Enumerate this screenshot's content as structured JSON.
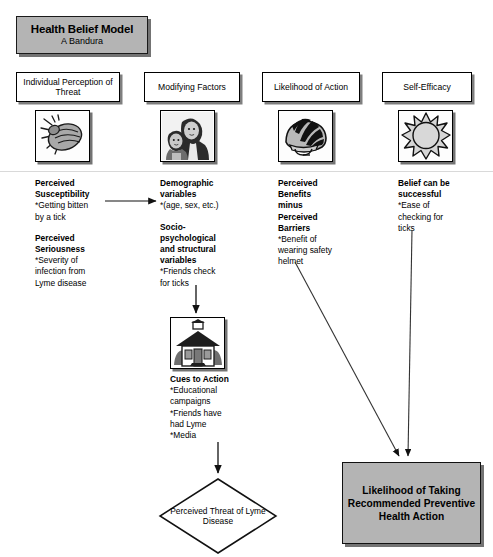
{
  "title": {
    "main": "Health Belief Model",
    "sub": "A Bandura"
  },
  "columns": [
    {
      "id": "individual-perception-of-threat",
      "header": "Individual Perception\nof Threat",
      "icon": "tick-icon",
      "blocks": [
        {
          "heading": "Perceived\nSusceptibility",
          "detail": "*Getting bitten\nby a tick"
        },
        {
          "heading": "Perceived\nSeriousness",
          "detail": "*Severity of\ninfection from\nLyme disease"
        }
      ]
    },
    {
      "id": "modifying-factors",
      "header": "Modifying Factors",
      "icon": "mother-and-child-icon",
      "blocks": [
        {
          "heading": "Demographic\nvariables",
          "detail": "*(age, sex, etc.)"
        },
        {
          "heading": "Socio-\npsychological\nand structural\nvariables",
          "detail": "*Friends check\nfor ticks"
        }
      ]
    },
    {
      "id": "likelihood-of-action",
      "header": "Likelihood of Action",
      "icon": "helmet-icon",
      "blocks": [
        {
          "heading": "Perceived\nBenefits\nminus\nPerceived\nBarriers",
          "detail": "*Benefit of\nwearing safety\nhelmet"
        }
      ]
    },
    {
      "id": "self-efficacy",
      "header": "Self-Efficacy",
      "icon": "sun-icon",
      "blocks": [
        {
          "heading": "Belief can be\nsuccessful",
          "detail": "*Ease of\nchecking for\nticks"
        }
      ]
    }
  ],
  "cues": {
    "icon": "schoolhouse-icon",
    "heading": "Cues to Action",
    "detail": "*Educational\ncampaigns\n*Friends have\nhad Lyme\n*Media"
  },
  "diamond": {
    "label": "Perceived\nThreat of\nLyme\nDisease"
  },
  "outcome": {
    "label": "Likelihood of Taking Recommended Preventive Health Action"
  },
  "colors": {
    "header_fill": "#b4b4b4",
    "outcome_fill": "#b4b4b4",
    "box_fill": "#ffffff",
    "stroke": "#000000",
    "divider": "#d9d9d9"
  }
}
